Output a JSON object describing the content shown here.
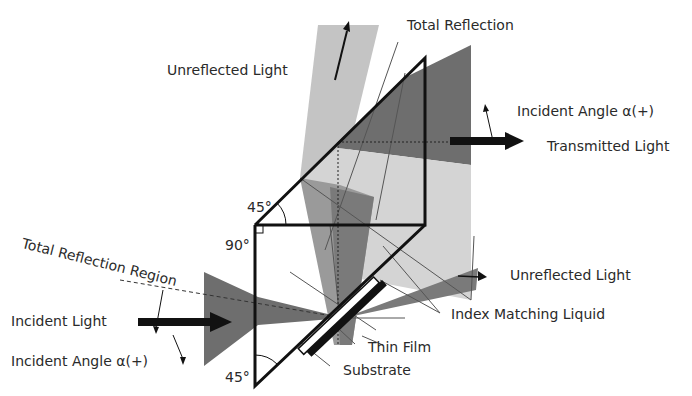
{
  "diagram": {
    "labels": {
      "total_reflection": "Total Reflection",
      "unreflected_light_top": "Unreflected Light",
      "incident_angle_top": "Incident Angle α(+)",
      "transmitted_light": "Transmitted Light",
      "total_reflection_region": "Total Reflection Region",
      "incident_light": "Incident Light",
      "incident_angle_bottom": "Incident Angle α(+)",
      "unreflected_light_right": "Unreflected Light",
      "index_matching_liquid": "Index Matching Liquid",
      "thin_film": "Thin Film",
      "substrate": "Substrate"
    },
    "angles": {
      "top_prism_angle": "45°",
      "right_angle": "90°",
      "bottom_prism_angle": "45°"
    },
    "colors": {
      "dark_beam": "#6e6e6e",
      "medium_beam": "#9a9a9a",
      "light_beam": "#c8c8c8",
      "lightest_beam": "#dcdcdc",
      "outline": "#111111"
    }
  }
}
